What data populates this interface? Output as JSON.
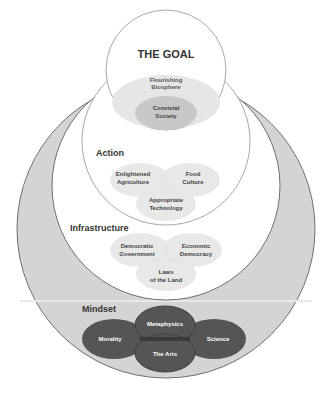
{
  "goal": {
    "title": "THE GOAL",
    "outer": [
      "Flourishing",
      "Biosphere"
    ],
    "inner": [
      "Convivial",
      "Society"
    ]
  },
  "action": {
    "title": "Action",
    "items": [
      [
        "Enlightened",
        "Agriculture"
      ],
      [
        "Food",
        "Culture"
      ],
      [
        "Appropriate",
        "Technology"
      ]
    ]
  },
  "infrastructure": {
    "title": "Infrastructure",
    "items": [
      [
        "Democratic",
        "Government"
      ],
      [
        "Economic",
        "Democracy"
      ],
      [
        "Laws",
        "of the Land"
      ]
    ]
  },
  "mindset": {
    "title": "Mindset",
    "items": [
      "Metaphysics",
      "Morality",
      "Science",
      "The Arts"
    ]
  },
  "colors": {
    "outer_fill": "#d4d4d4",
    "outer_stroke": "#707070",
    "light_ellipse": "#e6e6e6",
    "mid_ellipse": "#c8c8c8",
    "dark_ellipse": "#555555",
    "dark_overlap": "#3a3a3a",
    "circle_stroke": "#a8a8a8",
    "text": "#333333"
  }
}
